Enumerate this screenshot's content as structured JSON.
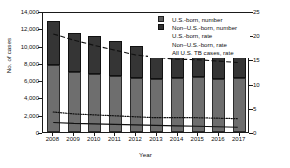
{
  "chart_data": {
    "type": "bar",
    "title": "",
    "xlabel": "Year",
    "ylabel": "No. of cases",
    "ylabel_right": "Cases per 100,000 population",
    "categories": [
      "2008",
      "2009",
      "2010",
      "2011",
      "2012",
      "2013",
      "2014",
      "2015",
      "2016",
      "2017"
    ],
    "ylim": [
      0,
      14000
    ],
    "ylim_right": [
      0,
      25
    ],
    "yticks": [
      "0",
      "2,000",
      "4,000",
      "6,000",
      "8,000",
      "10,000",
      "12,000",
      "14,000"
    ],
    "ytick_values": [
      0,
      2000,
      4000,
      6000,
      8000,
      10000,
      12000,
      14000
    ],
    "yticks_right": [
      "0",
      "5",
      "10",
      "15",
      "20",
      "25"
    ],
    "ytick_values_right": [
      0,
      5,
      10,
      15,
      20,
      25
    ],
    "grid": false,
    "legend_position": "top-right",
    "stacked": true,
    "series": [
      {
        "name": "U.S.-born, number",
        "kind": "bar",
        "axis": "left",
        "color": "#6e6e6e",
        "values": [
          7700,
          6900,
          6700,
          6450,
          6250,
          6100,
          6250,
          6350,
          6150,
          6200
        ]
      },
      {
        "name": "Non–U.S.-born, number",
        "kind": "bar",
        "axis": "left",
        "color": "#353535",
        "values": [
          5200,
          4600,
          4400,
          4050,
          3650,
          3400,
          3150,
          3000,
          3150,
          2900
        ]
      },
      {
        "name": "U.S.-born, rate",
        "kind": "line",
        "axis": "right",
        "style": "solid",
        "color": "#111111",
        "values": [
          2.0,
          1.8,
          1.7,
          1.6,
          1.5,
          1.4,
          1.3,
          1.2,
          1.1,
          1.0
        ]
      },
      {
        "name": "Non–U.S.-born, rate",
        "kind": "line",
        "axis": "right",
        "style": "dashed",
        "color": "#111111",
        "values": [
          20.6,
          19.3,
          18.2,
          17.2,
          16.2,
          15.7,
          15.3,
          15.2,
          14.9,
          14.6
        ]
      },
      {
        "name": "All U.S. TB cases, rate",
        "kind": "line",
        "axis": "right",
        "style": "dotted",
        "color": "#111111",
        "values": [
          4.2,
          3.8,
          3.6,
          3.4,
          3.2,
          3.0,
          3.0,
          3.0,
          2.9,
          2.8
        ]
      }
    ]
  },
  "legend": {
    "items": [
      {
        "label": "U.S.-born, number",
        "key": "swatch-us"
      },
      {
        "label": "Non–U.S.-born, number",
        "key": "swatch-non"
      },
      {
        "label": "U.S.-born, rate",
        "key": "line-solid"
      },
      {
        "label": "Non–U.S.-born, rate",
        "key": "line-dashed"
      },
      {
        "label": "All U.S. TB cases, rate",
        "key": "line-dotted"
      }
    ]
  },
  "colors": {
    "us_born_bar": "#6e6e6e",
    "non_us_born_bar": "#353535",
    "line": "#111111",
    "axis": "#1a1a1a",
    "background": "#ffffff"
  }
}
